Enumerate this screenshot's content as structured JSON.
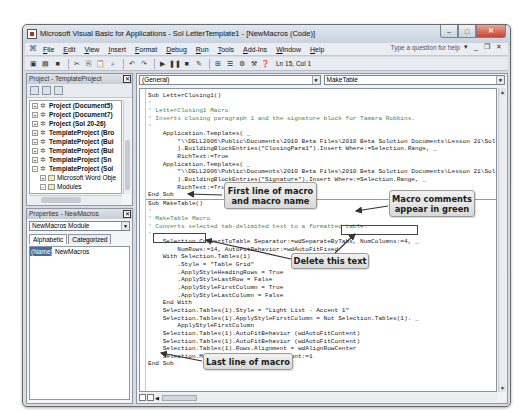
{
  "window": {
    "title": "Microsoft Visual Basic for Applications - Sol LetterTemplate1 - [NewMacros (Code)]",
    "controls": {
      "minimize": "–",
      "maximize": "□",
      "close": "✕"
    }
  },
  "menubar": {
    "items": [
      "File",
      "Edit",
      "View",
      "Insert",
      "Format",
      "Debug",
      "Run",
      "Tools",
      "Add-Ins",
      "Window",
      "Help"
    ],
    "help_placeholder": "Type a question for help",
    "right_controls": [
      "▾",
      "_",
      "❐",
      "✕"
    ]
  },
  "toolbar": {
    "position": "Ln 15, Col 1"
  },
  "project_pane": {
    "title": "Project - TemplateProject",
    "close": "✕",
    "tree": [
      {
        "label": "Project (Document5)",
        "expander": "+",
        "bold": true,
        "indent": 0,
        "icon": "project-icon"
      },
      {
        "label": "Project (Document7)",
        "expander": "+",
        "bold": true,
        "indent": 0,
        "icon": "project-icon"
      },
      {
        "label": "Project (Sol 20-26)",
        "expander": "+",
        "bold": true,
        "indent": 0,
        "icon": "project-icon"
      },
      {
        "label": "TemplateProject (Bro",
        "expander": "+",
        "bold": true,
        "indent": 0,
        "icon": "project-icon"
      },
      {
        "label": "TemplateProject (Bui",
        "expander": "+",
        "bold": true,
        "indent": 0,
        "icon": "project-icon"
      },
      {
        "label": "TemplateProject (Bui",
        "expander": "+",
        "bold": true,
        "indent": 0,
        "icon": "project-icon"
      },
      {
        "label": "TemplateProject (Sn",
        "expander": "+",
        "bold": true,
        "indent": 0,
        "icon": "project-icon"
      },
      {
        "label": "TemplateProject (Sol",
        "expander": "−",
        "bold": true,
        "indent": 0,
        "icon": "project-icon"
      },
      {
        "label": "Microsoft Word Obje",
        "expander": "+",
        "bold": false,
        "indent": 1,
        "icon": "folder-icon"
      },
      {
        "label": "Modules",
        "expander": "−",
        "bold": false,
        "indent": 1,
        "icon": "folder-icon"
      },
      {
        "label": "NewMacros",
        "expander": "",
        "bold": false,
        "indent": 2,
        "icon": "module-icon"
      }
    ]
  },
  "properties_pane": {
    "title": "Properties - NewMacros",
    "close": "✕",
    "object_select": "NewMacros Module",
    "tabs": [
      "Alphabetic",
      "Categorized"
    ],
    "rows": [
      {
        "key": "(Name)",
        "value": "NewMacros"
      }
    ]
  },
  "code_pane": {
    "object_combo": "(General)",
    "procedure_combo": "MakeTable",
    "sub1": [
      {
        "text": "Sub LetterClosing1()",
        "type": "code"
      },
      {
        "text": "'",
        "type": "comment"
      },
      {
        "text": "' LetterClosing1 Macro",
        "type": "comment"
      },
      {
        "text": "' Inserts closing paragraph 1 and the signature block for Tamara Robbins.",
        "type": "comment"
      },
      {
        "text": "'",
        "type": "comment"
      },
      {
        "text": "    Application.Templates( _",
        "type": "code"
      },
      {
        "text": "        \"\\\\DELL2006\\Public\\Documents\\2010 Beta Files\\2010 Beta Solution Documents\\Lesson 21\\Sol",
        "type": "code"
      },
      {
        "text": "        ).BuildingBlockEntries(\"ClosingPara1\").Insert Where:=Selection.Range, _",
        "type": "code"
      },
      {
        "text": "        RichText:=True",
        "type": "code"
      },
      {
        "text": "    Application.Templates( _",
        "type": "code"
      },
      {
        "text": "        \"\\\\DELL2006\\Public\\Documents\\2010 Beta Files\\2010 Beta Solution Documents\\Lesson 21\\Sol",
        "type": "code"
      },
      {
        "text": "        ).BuildingBlockEntries(\"Signature\").Insert Where:=Selection.Range, _",
        "type": "code"
      },
      {
        "text": "        RichText:=True",
        "type": "code"
      },
      {
        "text": "End Sub",
        "type": "code"
      }
    ],
    "sub2": [
      {
        "text": "Sub MakeTable()",
        "type": "code"
      },
      {
        "text": "'",
        "type": "comment"
      },
      {
        "text": "' MakeTable Macro",
        "type": "comment"
      },
      {
        "text": "' Converts selected tab-delimited text to a formatted table.",
        "type": "comment"
      },
      {
        "text": "'",
        "type": "comment"
      },
      {
        "text": "    Selection.ConvertToTable Separator:=wdSeparateByTabs, NumColumns:=4, _",
        "type": "code"
      },
      {
        "text": "        NumRows:=14, AutoFitBehavior:=wdAutoFitFixed",
        "type": "code"
      },
      {
        "text": "    With Selection.Tables(1)",
        "type": "code"
      },
      {
        "text": "        .Style = \"Table Grid\"",
        "type": "code"
      },
      {
        "text": "        .ApplyStyleHeadingRows = True",
        "type": "code"
      },
      {
        "text": "        .ApplyStyleLastRow = False",
        "type": "code"
      },
      {
        "text": "        .ApplyStyleFirstColumn = True",
        "type": "code"
      },
      {
        "text": "        .ApplyStyleLastColumn = False",
        "type": "code"
      },
      {
        "text": "    End With",
        "type": "code"
      },
      {
        "text": "    Selection.Tables(1).Style = \"Light List - Accent 1\"",
        "type": "code"
      },
      {
        "text": "    Selection.Tables(1).ApplyStyleFirstColumn = Not Selection.Tables(1). _",
        "type": "code"
      },
      {
        "text": "        ApplyStyleFirstColumn",
        "type": "code"
      },
      {
        "text": "    Selection.Tables(1).AutoFitBehavior (wdAutoFitContent)",
        "type": "code"
      },
      {
        "text": "    Selection.Tables(1).AutoFitBehavior (wdAutoFitContent)",
        "type": "code"
      },
      {
        "text": "    Selection.Tables(1).Rows.Alignment = wdAlignRowCenter",
        "type": "code"
      },
      {
        "text": "    Selection.MoveDown Unit:=wdLine, Count:=1",
        "type": "code"
      },
      {
        "text": "End Sub",
        "type": "code"
      }
    ]
  },
  "callouts": {
    "first_line": "First line of macro and macro name",
    "comments": "Macro comments appear in green",
    "delete": "Delete this text",
    "last_line": "Last line of macro"
  },
  "colors": {
    "comment_green": "#3f8a3f",
    "selection_blue": "#3a6ea5"
  }
}
